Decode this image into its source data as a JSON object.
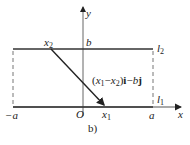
{
  "figure": {
    "caption": "b)",
    "axes": {
      "x_label": "x",
      "y_label": "y",
      "origin_label": "O"
    },
    "points": {
      "neg_a": "−a",
      "a": "a",
      "b": "b",
      "x1": "x",
      "x1_sub": "1",
      "x2": "x",
      "x2_sub": "2"
    },
    "lines": {
      "l1": "l",
      "l1_sub": "1",
      "l2": "l",
      "l2_sub": "2"
    },
    "vector_label": {
      "open": "(",
      "x1": "x",
      "x1_sub": "1",
      "minus": "−",
      "x2": "x",
      "x2_sub": "2",
      "close": ")",
      "i": "i",
      "minus2": "−",
      "b": "b",
      "j": "j"
    },
    "colors": {
      "line": "#333333",
      "dashed": "#777777",
      "axis": "#555555"
    }
  }
}
